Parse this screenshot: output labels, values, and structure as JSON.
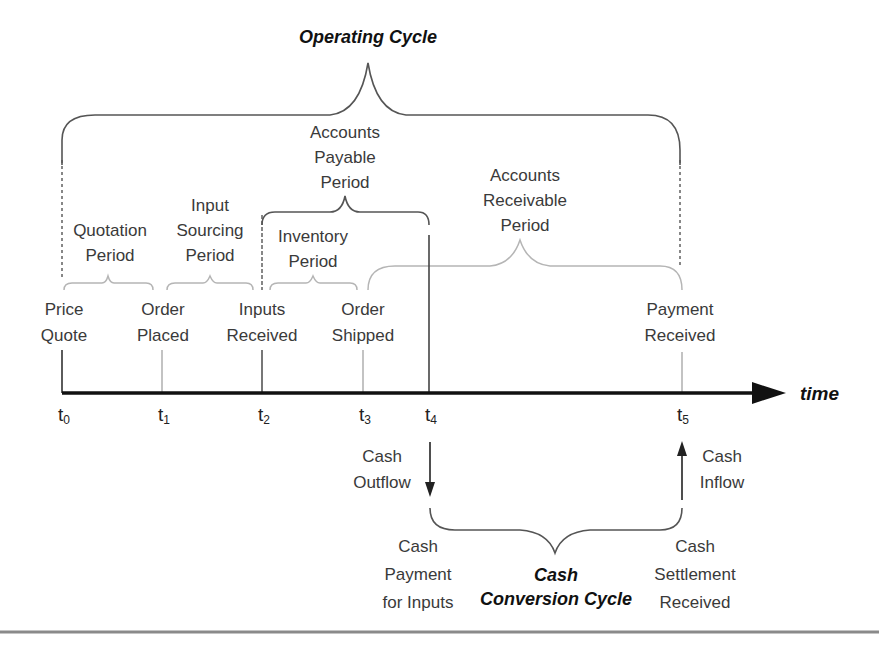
{
  "diagram": {
    "title_top": "Operating Cycle",
    "title_bottom": [
      "Cash",
      "Conversion Cycle"
    ],
    "axis_label": "time",
    "colors": {
      "axis": "#111111",
      "brace_dark": "#555555",
      "brace_light": "#b5b5b5",
      "text": "#3a3a3a",
      "rule": "#8a8a8a"
    },
    "ticks": [
      {
        "base": "t",
        "sub": "0"
      },
      {
        "base": "t",
        "sub": "1"
      },
      {
        "base": "t",
        "sub": "2"
      },
      {
        "base": "t",
        "sub": "3"
      },
      {
        "base": "t",
        "sub": "4"
      },
      {
        "base": "t",
        "sub": "5"
      }
    ],
    "events": [
      {
        "line1": "Price",
        "line2": "Quote"
      },
      {
        "line1": "Order",
        "line2": "Placed"
      },
      {
        "line1": "Inputs",
        "line2": "Received"
      },
      {
        "line1": "Order",
        "line2": "Shipped"
      },
      {
        "line1": "Payment",
        "line2": "Received"
      }
    ],
    "periods": {
      "quotation": [
        "Quotation",
        "Period"
      ],
      "input_sourcing": [
        "Input",
        "Sourcing",
        "Period"
      ],
      "inventory": [
        "Inventory",
        "Period"
      ],
      "accounts_payable": [
        "Accounts",
        "Payable",
        "Period"
      ],
      "accounts_receivable": [
        "Accounts",
        "Receivable",
        "Period"
      ]
    },
    "cash": {
      "outflow": [
        "Cash",
        "Outflow"
      ],
      "inflow": [
        "Cash",
        "Inflow"
      ],
      "payment": [
        "Cash",
        "Payment",
        "for Inputs"
      ],
      "settlement": [
        "Cash",
        "Settlement",
        "Received"
      ]
    }
  }
}
